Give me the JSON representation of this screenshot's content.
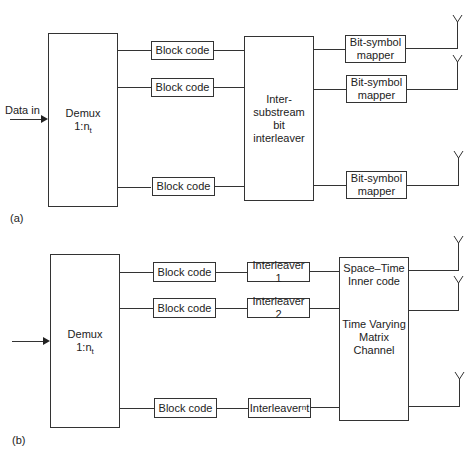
{
  "diagram_a": {
    "panel_label": "(a)",
    "input_label": "Data in",
    "demux": {
      "line1": "Demux",
      "line2_prefix": "1:n",
      "line2_sub": "t"
    },
    "block_codes": [
      "Block code",
      "Block code",
      "Block code"
    ],
    "interleaver": {
      "lines": [
        "Inter-",
        "substream",
        "bit",
        "interleaver"
      ]
    },
    "mappers": [
      {
        "line1": "Bit-symbol",
        "line2": "mapper"
      },
      {
        "line1": "Bit-symbol",
        "line2": "mapper"
      },
      {
        "line1": "Bit-symbol",
        "line2": "mapper"
      }
    ],
    "antennas": 3
  },
  "diagram_b": {
    "panel_label": "(b)",
    "demux": {
      "line1": "Demux",
      "line2_prefix": "1:n",
      "line2_sub": "t"
    },
    "block_codes": [
      "Block code",
      "Block code",
      "Block code"
    ],
    "interleavers": [
      {
        "text": "Interleaver 1"
      },
      {
        "text": "Interleaver 2"
      },
      {
        "prefix": "Interleaver",
        "sup": "n",
        "suffix": " t"
      }
    ],
    "space_time_box": {
      "top_lines": [
        "Space–Time",
        "Inner code"
      ],
      "bottom_lines": [
        "Time Varying",
        "Matrix",
        "Channel"
      ]
    },
    "antennas": 3
  },
  "colors": {
    "stroke": "#333333",
    "text": "#222222",
    "background": "#ffffff"
  }
}
